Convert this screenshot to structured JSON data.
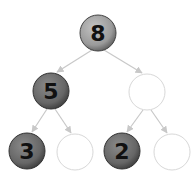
{
  "diagram": {
    "type": "binary-tree",
    "colors": {
      "edge": "#c8c8c8",
      "empty_node_stroke": "#d8d8d8",
      "root_fill": "#9a9a9a",
      "level1_fill": "#707070",
      "level2_fill": "#5e5e5e",
      "text": "#111111"
    },
    "nodes": [
      {
        "id": "root",
        "label": "8",
        "filled": true,
        "cx": 98,
        "cy": 33
      },
      {
        "id": "left",
        "label": "5",
        "filled": true,
        "cx": 51,
        "cy": 91
      },
      {
        "id": "right",
        "label": "",
        "filled": false,
        "cx": 147,
        "cy": 92
      },
      {
        "id": "left-left",
        "label": "3",
        "filled": true,
        "cx": 27,
        "cy": 151
      },
      {
        "id": "left-right",
        "label": "",
        "filled": false,
        "cx": 75,
        "cy": 152
      },
      {
        "id": "right-left",
        "label": "2",
        "filled": true,
        "cx": 122,
        "cy": 151
      },
      {
        "id": "right-right",
        "label": "",
        "filled": false,
        "cx": 172,
        "cy": 152
      }
    ],
    "edges": [
      {
        "from": "root",
        "to": "left"
      },
      {
        "from": "root",
        "to": "right"
      },
      {
        "from": "left",
        "to": "left-left"
      },
      {
        "from": "left",
        "to": "left-right"
      },
      {
        "from": "right",
        "to": "right-left"
      },
      {
        "from": "right",
        "to": "right-right"
      }
    ]
  }
}
